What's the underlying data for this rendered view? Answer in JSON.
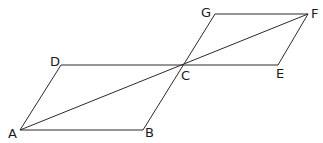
{
  "diagram": {
    "type": "geometry-figure",
    "stroke_color": "#2a2a2a",
    "points": {
      "A": {
        "label": "A",
        "x": 20,
        "y": 130
      },
      "B": {
        "label": "B",
        "x": 143,
        "y": 130
      },
      "C": {
        "label": "C",
        "x": 183,
        "y": 65
      },
      "D": {
        "label": "D",
        "x": 61,
        "y": 65
      },
      "E": {
        "label": "E",
        "x": 278,
        "y": 65
      },
      "F": {
        "label": "F",
        "x": 308,
        "y": 14
      },
      "G": {
        "label": "G",
        "x": 215,
        "y": 14
      }
    },
    "segments": [
      [
        "A",
        "B"
      ],
      [
        "B",
        "G"
      ],
      [
        "A",
        "D"
      ],
      [
        "D",
        "E"
      ],
      [
        "A",
        "F"
      ],
      [
        "G",
        "F"
      ],
      [
        "F",
        "E"
      ]
    ],
    "labels": {
      "A": "A",
      "B": "B",
      "C": "C",
      "D": "D",
      "E": "E",
      "F": "F",
      "G": "G"
    }
  }
}
